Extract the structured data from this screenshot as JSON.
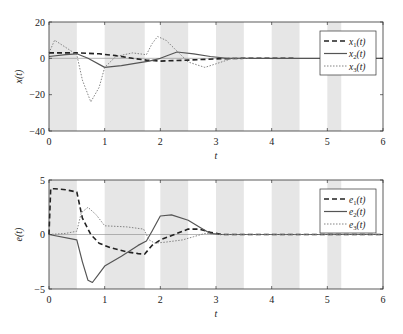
{
  "chart_data": [
    {
      "type": "line",
      "title": "",
      "xlabel": "t",
      "ylabel": "x(t)",
      "xlim": [
        0,
        6
      ],
      "ylim": [
        -40,
        20
      ],
      "xticks": [
        "0",
        "1",
        "2",
        "3",
        "4",
        "5",
        "6"
      ],
      "yticks": [
        "20",
        "0",
        "-20",
        "-40"
      ],
      "grid": false,
      "legend_position": "upper right",
      "shaded_intervals": [
        [
          0,
          0.5
        ],
        [
          1,
          1.72
        ],
        [
          2,
          2.5
        ],
        [
          3,
          3.5
        ],
        [
          4,
          4.5
        ],
        [
          5,
          5.25
        ]
      ],
      "series": [
        {
          "name": "x1(t)",
          "label_main": "x",
          "label_sub": "1",
          "style": "dashed",
          "x": [
            0,
            0.5,
            0.9,
            1.2,
            1.5,
            1.75,
            2.0,
            2.5,
            3.0,
            3.5,
            4.4
          ],
          "y": [
            3,
            3,
            2.5,
            1.5,
            0,
            -1,
            -1.5,
            -1,
            -0.3,
            0,
            0
          ]
        },
        {
          "name": "x2(t)",
          "label_main": "x",
          "label_sub": "2",
          "style": "solid",
          "x": [
            0,
            0.3,
            0.5,
            0.7,
            1.0,
            1.3,
            1.6,
            1.8,
            2.0,
            2.3,
            2.6,
            2.9,
            3.2,
            3.5,
            6.0
          ],
          "y": [
            1,
            2,
            2.5,
            0,
            -5,
            -4,
            -2.5,
            -1.5,
            0,
            3.5,
            2.5,
            1,
            0,
            0,
            0
          ]
        },
        {
          "name": "x3(t)",
          "label_main": "x",
          "label_sub": "3",
          "style": "dotted",
          "x": [
            0,
            0.1,
            0.3,
            0.5,
            0.6,
            0.75,
            0.9,
            1.0,
            1.2,
            1.5,
            1.75,
            1.85,
            1.95,
            2.1,
            2.3,
            2.5,
            2.8,
            3.0,
            3.3,
            3.6
          ],
          "y": [
            3,
            10,
            6,
            2,
            -12,
            -24,
            -16,
            -5,
            1,
            3,
            2,
            8,
            12,
            10,
            4,
            -2,
            -5,
            -3,
            0,
            0
          ]
        }
      ]
    },
    {
      "type": "line",
      "title": "",
      "xlabel": "t",
      "ylabel": "e(t)",
      "xlim": [
        0,
        6
      ],
      "ylim": [
        -5,
        5
      ],
      "xticks": [
        "0",
        "1",
        "2",
        "3",
        "4",
        "5",
        "6"
      ],
      "yticks": [
        "5",
        "0",
        "-5"
      ],
      "grid": false,
      "legend_position": "upper right",
      "shaded_intervals": [
        [
          0,
          0.5
        ],
        [
          1,
          1.72
        ],
        [
          2,
          2.5
        ],
        [
          3,
          3.5
        ],
        [
          4,
          4.5
        ],
        [
          5,
          5.25
        ]
      ],
      "series": [
        {
          "name": "e1(t)",
          "label_main": "e",
          "label_sub": "1",
          "style": "dashed",
          "x": [
            0,
            0.03,
            0.1,
            0.3,
            0.5,
            0.6,
            0.75,
            0.9,
            1.1,
            1.4,
            1.6,
            1.72,
            1.85,
            2.0,
            2.3,
            2.5,
            2.7,
            2.9,
            3.1,
            6.0
          ],
          "y": [
            0,
            4.2,
            4.2,
            4.1,
            3.9,
            1.5,
            0,
            -0.8,
            -1.2,
            -1.6,
            -1.75,
            -1.8,
            -1.0,
            -0.5,
            0.1,
            0.5,
            0.5,
            0.2,
            0,
            0
          ]
        },
        {
          "name": "e2(t)",
          "label_main": "e",
          "label_sub": "2",
          "style": "solid",
          "x": [
            0,
            0.5,
            0.6,
            0.7,
            0.78,
            0.9,
            1.0,
            1.3,
            1.6,
            1.75,
            1.85,
            2.0,
            2.2,
            2.5,
            2.7,
            2.9,
            3.1,
            6.0
          ],
          "y": [
            0,
            -0.5,
            -2.5,
            -4.2,
            -4.4,
            -3.6,
            -2.9,
            -2.0,
            -1.0,
            -0.6,
            0.3,
            1.7,
            1.8,
            1.3,
            0.7,
            0.1,
            0,
            0
          ]
        },
        {
          "name": "e3(t)",
          "label_main": "e",
          "label_sub": "3",
          "style": "dotted",
          "x": [
            0,
            0.3,
            0.5,
            0.58,
            0.7,
            0.85,
            1.0,
            1.4,
            1.7,
            1.8,
            1.9,
            2.1,
            2.4,
            2.6,
            2.8,
            3.1,
            6.0
          ],
          "y": [
            0,
            0.1,
            0.3,
            2.0,
            2.5,
            1.8,
            0.8,
            0.7,
            0.5,
            -0.5,
            -0.8,
            -0.7,
            -0.5,
            -0.2,
            0.1,
            0,
            0
          ]
        }
      ]
    }
  ]
}
